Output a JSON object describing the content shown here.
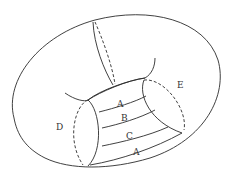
{
  "diagram": {
    "stroke_color": "#2b2b2b",
    "background": "#ffffff",
    "labels": {
      "band_top_A": "A",
      "band_B": "B",
      "band_C": "C",
      "band_bottom_A": "A",
      "left_circle": "D",
      "right_circle": "E"
    }
  }
}
